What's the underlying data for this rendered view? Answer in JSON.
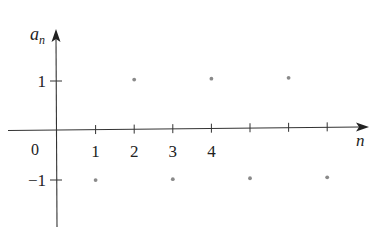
{
  "chart_data": {
    "type": "scatter",
    "title": "",
    "xlabel": "n",
    "ylabel": "a_n",
    "ylabel_main": "a",
    "ylabel_sub": "n",
    "x": [
      1,
      2,
      3,
      4,
      5,
      6,
      7
    ],
    "y": [
      -1,
      1,
      -1,
      1,
      -1,
      1,
      -1
    ],
    "series": [
      {
        "name": "a_n",
        "x": [
          1,
          2,
          3,
          4,
          5,
          6,
          7
        ],
        "values": [
          -1,
          1,
          -1,
          1,
          -1,
          1,
          -1
        ]
      }
    ],
    "x_ticks": [
      1,
      2,
      3,
      4,
      5,
      6,
      7
    ],
    "x_tick_labels": [
      "1",
      "2",
      "3",
      "4"
    ],
    "y_ticks": [
      1,
      -1
    ],
    "y_tick_labels": [
      "1",
      "−1"
    ],
    "origin_label": "0",
    "xlim": [
      0,
      8
    ],
    "ylim": [
      -2.3,
      2.6
    ],
    "grid": false,
    "legend": "none",
    "colors": {
      "axis": "#333333",
      "point": "#8a8a8a",
      "text": "#222222"
    }
  }
}
